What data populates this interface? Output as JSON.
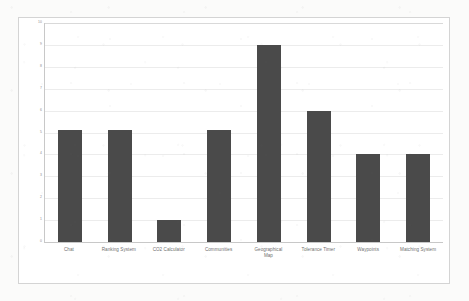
{
  "chart_data": {
    "type": "bar",
    "title": "",
    "subtitle": "",
    "xlabel": "",
    "ylabel": "",
    "ylim": [
      0,
      10
    ],
    "yticks": [
      0,
      1,
      2,
      3,
      4,
      5,
      6,
      7,
      8,
      9,
      10
    ],
    "ytick_labels": [
      "0",
      "1",
      "2",
      "3",
      "4",
      "5",
      "6",
      "7",
      "8",
      "9",
      "10"
    ],
    "grid": true,
    "legend": false,
    "legend_position": "none",
    "bar_color": "#4a4a4a",
    "categories": [
      "Chat",
      "Ranking System",
      "CO2 Calculator",
      "Communities",
      "Geographical Map",
      "Tolerance Timer",
      "Waypoints",
      "Matching System"
    ],
    "category_lines": [
      [
        "Chat"
      ],
      [
        "Ranking System"
      ],
      [
        "CO2 Calculator"
      ],
      [
        "Communities"
      ],
      [
        "Geographical",
        "Map"
      ],
      [
        "Tolerance Timer"
      ],
      [
        "Waypoints"
      ],
      [
        "Matching System"
      ]
    ],
    "values": [
      5.1,
      5.1,
      1,
      5.1,
      9,
      6,
      4,
      4
    ]
  },
  "colors": {
    "bar": "#4a4a4a",
    "gridline": "#ececec",
    "axis": "#c8c8c8",
    "frame_border": "#d4d4d4",
    "plot_background": "#ffffff",
    "page_background": "#fbfbfa",
    "tick_text": "#8d8d8d",
    "category_text": "#6f6f6f"
  }
}
